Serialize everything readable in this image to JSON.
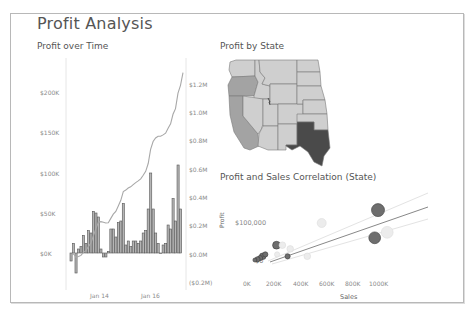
{
  "dashboard": {
    "title": "Profit Analysis"
  },
  "sheets": {
    "profit_over_time": {
      "title": "Profit over Time",
      "left_axis_ticks": [
        "$200K",
        "$150K",
        "$100K",
        "$50K",
        "$0K"
      ],
      "right_axis_ticks": [
        "$1.2M",
        "$1.0M",
        "$0.8M",
        "$0.6M",
        "$0.4M",
        "$0.2M",
        "$0.0M",
        "($0.2M)"
      ],
      "x_ticks": [
        "Jan 14",
        "Jan 16"
      ]
    },
    "profit_by_state": {
      "title": "Profit by State"
    },
    "correlation": {
      "title": "Profit and Sales Correlation (State)",
      "y_label": "Profit",
      "x_label": "Sales",
      "y_ticks": [
        "$100,000",
        "$0"
      ],
      "x_ticks": [
        "0K",
        "200K",
        "400K",
        "600K",
        "800K",
        "1000K"
      ]
    }
  },
  "colors": {
    "bar_fill": "#b5b5b5",
    "bar_stroke": "#555555",
    "line": "#a8a8a8",
    "map_light": "#cfcfcf",
    "map_mid": "#a3a3a3",
    "map_dark": "#4a4a4a",
    "trend": "#888888"
  },
  "chart_data": [
    {
      "type": "bar",
      "title": "Profit over Time",
      "xlabel": "",
      "ylabel": "Profit",
      "ylim": [
        -30000,
        230000
      ],
      "secondary_ylim": [
        -200000,
        1300000
      ],
      "x_ticks": [
        "Jan 14",
        "Jan 16"
      ],
      "series": [
        {
          "name": "Monthly Profit",
          "type": "bar",
          "values": [
            -10000,
            12000,
            -25000,
            5000,
            8000,
            22000,
            12000,
            28000,
            25000,
            52000,
            50000,
            45000,
            5000,
            -5000,
            -5000,
            2000,
            30000,
            30000,
            20000,
            38000,
            40000,
            62000,
            10000,
            15000,
            8000,
            15000,
            15000,
            12000,
            15000,
            25000,
            28000,
            55000,
            100000,
            55000,
            25000,
            12000,
            0,
            10000,
            12000,
            35000,
            30000,
            68000,
            40000,
            110000,
            55000
          ]
        },
        {
          "name": "Running Total Profit",
          "type": "line",
          "axis": "secondary",
          "values": [
            -10000,
            2000,
            -23000,
            -18000,
            -10000,
            12000,
            24000,
            52000,
            77000,
            129000,
            179000,
            224000,
            229000,
            224000,
            219000,
            221000,
            251000,
            281000,
            301000,
            339000,
            379000,
            441000,
            451000,
            466000,
            474000,
            489000,
            504000,
            516000,
            531000,
            556000,
            584000,
            639000,
            739000,
            794000,
            819000,
            831000,
            831000,
            841000,
            853000,
            888000,
            918000,
            986000,
            1026000,
            1136000,
            1191000,
            1280000
          ]
        }
      ]
    },
    {
      "type": "map",
      "title": "Profit by State",
      "regions": [
        {
          "state": "Washington",
          "shade": "light"
        },
        {
          "state": "Oregon",
          "shade": "mid"
        },
        {
          "state": "California",
          "shade": "mid"
        },
        {
          "state": "Texas",
          "shade": "dark"
        },
        {
          "state": "Other western/central states",
          "shade": "light"
        }
      ]
    },
    {
      "type": "scatter",
      "title": "Profit and Sales Correlation (State)",
      "xlabel": "Sales",
      "ylabel": "Profit",
      "xlim": [
        0,
        1100000
      ],
      "ylim": [
        -15000,
        160000
      ],
      "x_ticks": [
        "0K",
        "200K",
        "400K",
        "600K",
        "800K",
        "1000K"
      ],
      "y_ticks": [
        "$0",
        "$100,000"
      ],
      "points": [
        {
          "x": 1000000,
          "y": 135000,
          "size": 10,
          "shade": "dark"
        },
        {
          "x": 975000,
          "y": 60000,
          "size": 9,
          "shade": "dark"
        },
        {
          "x": 1070000,
          "y": 75000,
          "size": 9,
          "shade": "faint"
        },
        {
          "x": 570000,
          "y": 100000,
          "size": 7,
          "shade": "faint"
        },
        {
          "x": 460000,
          "y": 10000,
          "size": 5,
          "shade": "faint"
        },
        {
          "x": 225000,
          "y": 40000,
          "size": 6,
          "shade": "dark"
        },
        {
          "x": 310000,
          "y": 10000,
          "size": 4,
          "shade": "dark"
        },
        {
          "x": 120000,
          "y": 10000,
          "size": 5,
          "shade": "dark"
        },
        {
          "x": 100000,
          "y": 5000,
          "size": 4,
          "shade": "dark"
        },
        {
          "x": 80000,
          "y": 2000,
          "size": 4,
          "shade": "dark"
        },
        {
          "x": 140000,
          "y": 15000,
          "size": 4,
          "shade": "dark"
        },
        {
          "x": 60000,
          "y": 0,
          "size": 3,
          "shade": "dark"
        },
        {
          "x": 270000,
          "y": 40000,
          "size": 5,
          "shade": "faint"
        },
        {
          "x": 230000,
          "y": 15000,
          "size": 4,
          "shade": "faint"
        },
        {
          "x": 330000,
          "y": 30000,
          "size": 5,
          "shade": "faint"
        }
      ],
      "trend_lines": 3
    }
  ]
}
